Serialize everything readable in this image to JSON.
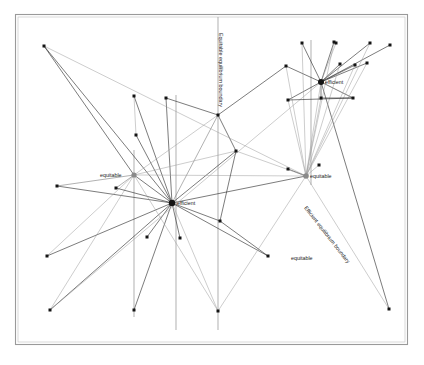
{
  "figure": {
    "kind": "network-diagram",
    "background_color": "#ffffff",
    "frame": {
      "x": 15.5,
      "y": 14.5,
      "width": 392,
      "height": 330,
      "stroke_color": "#9a9a9a",
      "stroke_width": 1.1,
      "inner_stroke_color": "#c9c9c9"
    },
    "palette": {
      "dark_edge": "#2b2b2b",
      "light_edge": "#9b9b9b",
      "mid_edge": "#6f6f6f",
      "vertical_line": "#a2a2a2",
      "node_dark": "#141414",
      "node_light": "#8a8a8a",
      "label_text": "#1a1a1a"
    }
  },
  "labels": {
    "hubs": [
      {
        "id": "hub-efficient-left",
        "text": "efficient",
        "x": 177,
        "y": 205,
        "anchor": "start"
      },
      {
        "id": "hub-equitable-left",
        "text": "equitable",
        "x": 100,
        "y": 177,
        "anchor": "start"
      },
      {
        "id": "hub-efficient-right",
        "text": "efficient",
        "x": 325,
        "y": 84,
        "anchor": "start"
      },
      {
        "id": "hub-equitable-right",
        "text": "equitable",
        "x": 310,
        "y": 178,
        "anchor": "start"
      },
      {
        "id": "label-equitable-bottom",
        "text": "equitable",
        "x": 291,
        "y": 260,
        "anchor": "start"
      }
    ],
    "boundaries": [
      {
        "id": "equitable-equilibrium-boundary",
        "text": "Equitable equilibrium boundary",
        "x": 219,
        "y": 33,
        "rotation": 90
      },
      {
        "id": "efficient-equilibrium-boundary",
        "text": "Efficient equilibrium boundary",
        "x": 304,
        "y": 208,
        "rotation": 52
      }
    ]
  },
  "chart_data": {
    "type": "scatter",
    "title": "",
    "vertical_boundaries": [
      {
        "id": "v1",
        "x": 134,
        "y1": 150,
        "y2": 317
      },
      {
        "id": "v2",
        "x": 176,
        "y1": 95,
        "y2": 330
      },
      {
        "id": "v3",
        "x": 218,
        "y1": 17,
        "y2": 330
      },
      {
        "id": "v4",
        "x": 311,
        "y1": 40,
        "y2": 185
      }
    ],
    "hubs": [
      {
        "id": "efficient-left",
        "x": 172,
        "y": 203,
        "r": 3.2,
        "tone": "dark"
      },
      {
        "id": "equitable-left",
        "x": 134,
        "y": 175,
        "r": 2.6,
        "tone": "light"
      },
      {
        "id": "efficient-right",
        "x": 321,
        "y": 82,
        "r": 3.0,
        "tone": "dark"
      },
      {
        "id": "equitable-right",
        "x": 306,
        "y": 176,
        "r": 2.8,
        "tone": "light"
      }
    ],
    "leaf_nodes": [
      {
        "x": 44,
        "y": 46
      },
      {
        "x": 57,
        "y": 186
      },
      {
        "x": 47,
        "y": 256
      },
      {
        "x": 50,
        "y": 310
      },
      {
        "x": 116,
        "y": 188
      },
      {
        "x": 134,
        "y": 96
      },
      {
        "x": 134,
        "y": 310
      },
      {
        "x": 166,
        "y": 98
      },
      {
        "x": 136,
        "y": 135
      },
      {
        "x": 180,
        "y": 238
      },
      {
        "x": 218,
        "y": 115
      },
      {
        "x": 218,
        "y": 311
      },
      {
        "x": 220,
        "y": 221
      },
      {
        "x": 236,
        "y": 151
      },
      {
        "x": 268,
        "y": 256
      },
      {
        "x": 286,
        "y": 66
      },
      {
        "x": 288,
        "y": 100
      },
      {
        "x": 302,
        "y": 43
      },
      {
        "x": 319,
        "y": 165
      },
      {
        "x": 321,
        "y": 98
      },
      {
        "x": 334,
        "y": 42
      },
      {
        "x": 336,
        "y": 43
      },
      {
        "x": 340,
        "y": 64
      },
      {
        "x": 353,
        "y": 98
      },
      {
        "x": 355,
        "y": 65
      },
      {
        "x": 367,
        "y": 63
      },
      {
        "x": 370,
        "y": 43
      },
      {
        "x": 390,
        "y": 45
      },
      {
        "x": 389,
        "y": 309
      },
      {
        "x": 147,
        "y": 237
      },
      {
        "x": 288,
        "y": 169
      }
    ],
    "edges": [
      {
        "from": [
          44,
          46
        ],
        "to": [
          172,
          203
        ],
        "tone": "dark"
      },
      {
        "from": [
          44,
          46
        ],
        "to": [
          134,
          175
        ],
        "tone": "dark"
      },
      {
        "from": [
          57,
          186
        ],
        "to": [
          134,
          175
        ],
        "tone": "mid"
      },
      {
        "from": [
          57,
          186
        ],
        "to": [
          172,
          203
        ],
        "tone": "dark"
      },
      {
        "from": [
          47,
          256
        ],
        "to": [
          172,
          203
        ],
        "tone": "dark"
      },
      {
        "from": [
          47,
          256
        ],
        "to": [
          134,
          175
        ],
        "tone": "light"
      },
      {
        "from": [
          50,
          310
        ],
        "to": [
          172,
          203
        ],
        "tone": "dark"
      },
      {
        "from": [
          50,
          310
        ],
        "to": [
          134,
          175
        ],
        "tone": "light"
      },
      {
        "from": [
          116,
          188
        ],
        "to": [
          172,
          203
        ],
        "tone": "dark"
      },
      {
        "from": [
          134,
          96
        ],
        "to": [
          172,
          203
        ],
        "tone": "dark"
      },
      {
        "from": [
          134,
          310
        ],
        "to": [
          172,
          203
        ],
        "tone": "dark"
      },
      {
        "from": [
          136,
          135
        ],
        "to": [
          172,
          203
        ],
        "tone": "dark"
      },
      {
        "from": [
          166,
          98
        ],
        "to": [
          172,
          203
        ],
        "tone": "dark"
      },
      {
        "from": [
          180,
          238
        ],
        "to": [
          172,
          203
        ],
        "tone": "dark"
      },
      {
        "from": [
          147,
          237
        ],
        "to": [
          172,
          203
        ],
        "tone": "dark"
      },
      {
        "from": [
          218,
          115
        ],
        "to": [
          172,
          203
        ],
        "tone": "mid"
      },
      {
        "from": [
          218,
          311
        ],
        "to": [
          172,
          203
        ],
        "tone": "light"
      },
      {
        "from": [
          220,
          221
        ],
        "to": [
          172,
          203
        ],
        "tone": "dark"
      },
      {
        "from": [
          236,
          151
        ],
        "to": [
          172,
          203
        ],
        "tone": "dark"
      },
      {
        "from": [
          268,
          256
        ],
        "to": [
          172,
          203
        ],
        "tone": "dark"
      },
      {
        "from": [
          306,
          176
        ],
        "to": [
          172,
          203
        ],
        "tone": "dark"
      },
      {
        "from": [
          134,
          175
        ],
        "to": [
          172,
          203
        ],
        "tone": "dark"
      },
      {
        "from": [
          134,
          175
        ],
        "to": [
          218,
          115
        ],
        "tone": "light"
      },
      {
        "from": [
          134,
          175
        ],
        "to": [
          236,
          151
        ],
        "tone": "light"
      },
      {
        "from": [
          134,
          175
        ],
        "to": [
          218,
          311
        ],
        "tone": "light"
      },
      {
        "from": [
          134,
          175
        ],
        "to": [
          306,
          176
        ],
        "tone": "light"
      },
      {
        "from": [
          286,
          66
        ],
        "to": [
          321,
          82
        ],
        "tone": "dark"
      },
      {
        "from": [
          288,
          100
        ],
        "to": [
          321,
          82
        ],
        "tone": "dark"
      },
      {
        "from": [
          302,
          43
        ],
        "to": [
          321,
          82
        ],
        "tone": "dark"
      },
      {
        "from": [
          321,
          98
        ],
        "to": [
          321,
          82
        ],
        "tone": "dark"
      },
      {
        "from": [
          334,
          42
        ],
        "to": [
          321,
          82
        ],
        "tone": "dark"
      },
      {
        "from": [
          336,
          43
        ],
        "to": [
          321,
          82
        ],
        "tone": "light"
      },
      {
        "from": [
          340,
          64
        ],
        "to": [
          321,
          82
        ],
        "tone": "dark"
      },
      {
        "from": [
          353,
          98
        ],
        "to": [
          321,
          82
        ],
        "tone": "dark"
      },
      {
        "from": [
          355,
          65
        ],
        "to": [
          321,
          82
        ],
        "tone": "dark"
      },
      {
        "from": [
          367,
          63
        ],
        "to": [
          321,
          82
        ],
        "tone": "dark"
      },
      {
        "from": [
          370,
          43
        ],
        "to": [
          321,
          82
        ],
        "tone": "dark"
      },
      {
        "from": [
          390,
          45
        ],
        "to": [
          321,
          82
        ],
        "tone": "dark"
      },
      {
        "from": [
          306,
          176
        ],
        "to": [
          321,
          82
        ],
        "tone": "light"
      },
      {
        "from": [
          389,
          309
        ],
        "to": [
          321,
          82
        ],
        "tone": "dark"
      },
      {
        "from": [
          50,
          310
        ],
        "to": [
          321,
          82
        ],
        "tone": "light"
      },
      {
        "from": [
          286,
          66
        ],
        "to": [
          306,
          176
        ],
        "tone": "light"
      },
      {
        "from": [
          288,
          100
        ],
        "to": [
          306,
          176
        ],
        "tone": "light"
      },
      {
        "from": [
          302,
          43
        ],
        "to": [
          306,
          176
        ],
        "tone": "light"
      },
      {
        "from": [
          321,
          98
        ],
        "to": [
          306,
          176
        ],
        "tone": "light"
      },
      {
        "from": [
          334,
          42
        ],
        "to": [
          306,
          176
        ],
        "tone": "light"
      },
      {
        "from": [
          340,
          64
        ],
        "to": [
          306,
          176
        ],
        "tone": "light"
      },
      {
        "from": [
          355,
          65
        ],
        "to": [
          306,
          176
        ],
        "tone": "light"
      },
      {
        "from": [
          367,
          63
        ],
        "to": [
          306,
          176
        ],
        "tone": "light"
      },
      {
        "from": [
          370,
          43
        ],
        "to": [
          306,
          176
        ],
        "tone": "light"
      },
      {
        "from": [
          288,
          169
        ],
        "to": [
          306,
          176
        ],
        "tone": "dark"
      },
      {
        "from": [
          319,
          165
        ],
        "to": [
          306,
          176
        ],
        "tone": "light"
      },
      {
        "from": [
          218,
          311
        ],
        "to": [
          306,
          176
        ],
        "tone": "light"
      },
      {
        "from": [
          389,
          309
        ],
        "to": [
          306,
          176
        ],
        "tone": "light"
      },
      {
        "from": [
          236,
          151
        ],
        "to": [
          306,
          176
        ],
        "tone": "light"
      },
      {
        "from": [
          220,
          221
        ],
        "to": [
          268,
          256
        ],
        "tone": "dark"
      },
      {
        "from": [
          220,
          221
        ],
        "to": [
          236,
          151
        ],
        "tone": "dark"
      },
      {
        "from": [
          236,
          151
        ],
        "to": [
          218,
          115
        ],
        "tone": "dark"
      },
      {
        "from": [
          218,
          115
        ],
        "to": [
          166,
          98
        ],
        "tone": "dark"
      },
      {
        "from": [
          218,
          115
        ],
        "to": [
          286,
          66
        ],
        "tone": "dark"
      },
      {
        "from": [
          288,
          100
        ],
        "to": [
          353,
          98
        ],
        "tone": "dark"
      },
      {
        "from": [
          321,
          98
        ],
        "to": [
          353,
          98
        ],
        "tone": "dark"
      },
      {
        "from": [
          136,
          135
        ],
        "to": [
          134,
          96
        ],
        "tone": "light"
      },
      {
        "from": [
          44,
          46
        ],
        "to": [
          306,
          176
        ],
        "tone": "light"
      },
      {
        "from": [
          116,
          188
        ],
        "to": [
          134,
          175
        ],
        "tone": "mid"
      }
    ]
  }
}
